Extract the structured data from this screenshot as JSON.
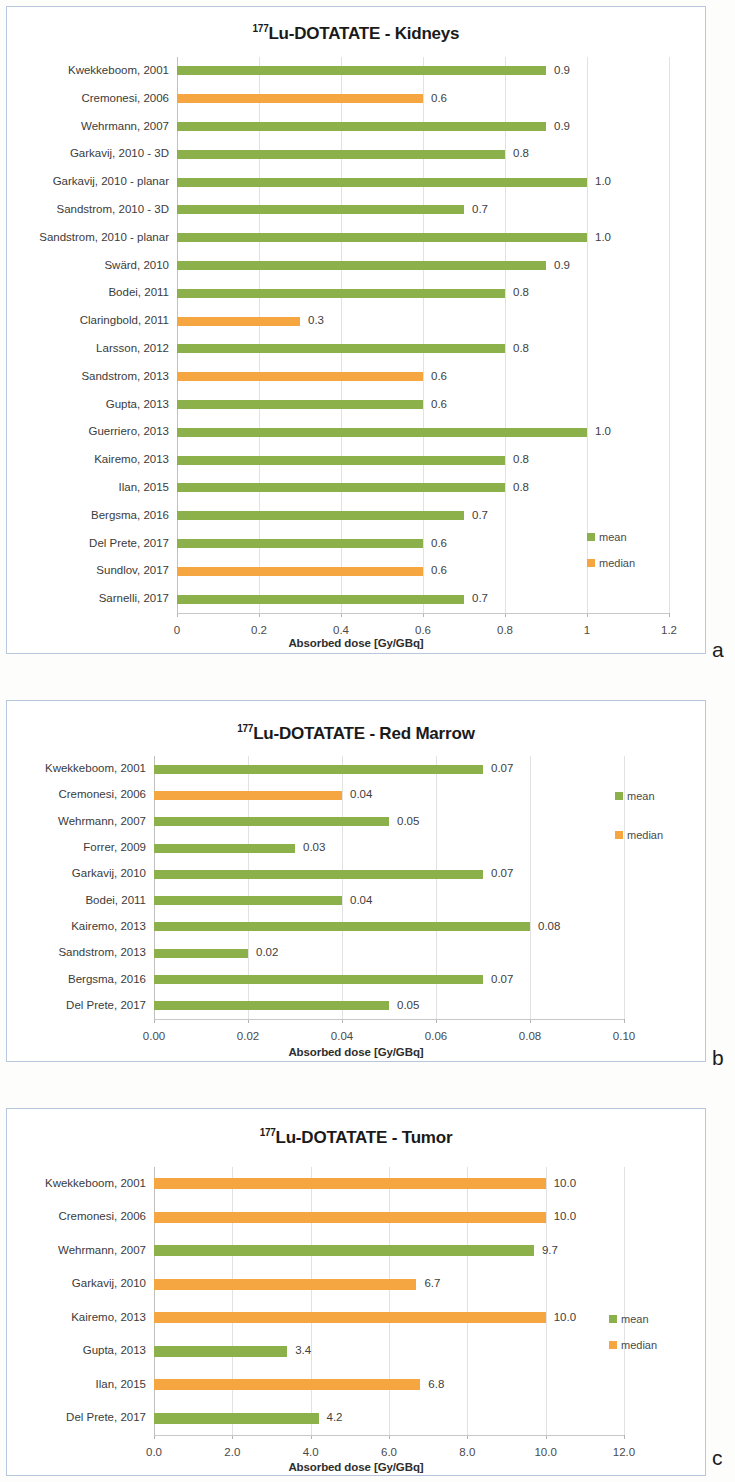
{
  "colors": {
    "mean": "#8CB04A",
    "median": "#F5A641",
    "panel_border": "#b9c7dd",
    "grid": "#e2e2e2",
    "text": "#3b3b3b"
  },
  "legend_labels": {
    "mean": "mean",
    "median": "median"
  },
  "panels": [
    {
      "letter": "a"
    },
    {
      "letter": "b"
    },
    {
      "letter": "c"
    }
  ],
  "chart_data": [
    {
      "type": "bar",
      "orientation": "horizontal",
      "title_prefix": "177",
      "title": "Lu-DOTATATE - Kidneys",
      "xlabel": "Absorbed dose [Gy/GBq]",
      "ylabel": "",
      "xlim": [
        0,
        1.2
      ],
      "xticks": [
        0,
        0.2,
        0.4,
        0.6,
        0.8,
        1,
        1.2
      ],
      "xticklabels": [
        "0",
        "0.2",
        "0.4",
        "0.6",
        "0.8",
        "1",
        "1.2"
      ],
      "grid": true,
      "legend_position": "right-lower",
      "legend": [
        "mean",
        "median"
      ],
      "categories": [
        "Kwekkeboom, 2001",
        "Cremonesi, 2006",
        "Wehrmann, 2007",
        "Garkavij, 2010 - 3D",
        "Garkavij, 2010 - planar",
        "Sandstrom, 2010 - 3D",
        "Sandstrom, 2010 - planar",
        "Swärd, 2010",
        "Bodei, 2011",
        "Claringbold, 2011",
        "Larsson, 2012",
        "Sandstrom, 2013",
        "Gupta, 2013",
        "Guerriero, 2013",
        "Kairemo, 2013",
        "Ilan, 2015",
        "Bergsma, 2016",
        "Del Prete, 2017",
        "Sundlov, 2017",
        "Sarnelli, 2017"
      ],
      "values": [
        0.9,
        0.6,
        0.9,
        0.8,
        1.0,
        0.7,
        1.0,
        0.9,
        0.8,
        0.3,
        0.8,
        0.6,
        0.6,
        1.0,
        0.8,
        0.8,
        0.7,
        0.6,
        0.6,
        0.7
      ],
      "value_labels": [
        "0.9",
        "0.6",
        "0.9",
        "0.8",
        "1.0",
        "0.7",
        "1.0",
        "0.9",
        "0.8",
        "0.3",
        "0.8",
        "0.6",
        "0.6",
        "1.0",
        "0.8",
        "0.8",
        "0.7",
        "0.6",
        "0.6",
        "0.7"
      ],
      "series_of": [
        "mean",
        "median",
        "mean",
        "mean",
        "mean",
        "mean",
        "mean",
        "mean",
        "mean",
        "median",
        "mean",
        "median",
        "mean",
        "mean",
        "mean",
        "mean",
        "mean",
        "mean",
        "median",
        "mean"
      ]
    },
    {
      "type": "bar",
      "orientation": "horizontal",
      "title_prefix": "177",
      "title": "Lu-DOTATATE - Red Marrow",
      "xlabel": "Absorbed dose [Gy/GBq]",
      "ylabel": "",
      "xlim": [
        0,
        0.1
      ],
      "xticks": [
        0,
        0.02,
        0.04,
        0.06,
        0.08,
        0.1
      ],
      "xticklabels": [
        "0.00",
        "0.02",
        "0.04",
        "0.06",
        "0.08",
        "0.10"
      ],
      "grid": true,
      "legend_position": "right-upper",
      "legend": [
        "mean",
        "median"
      ],
      "categories": [
        "Kwekkeboom, 2001",
        "Cremonesi, 2006",
        "Wehrmann, 2007",
        "Forrer, 2009",
        "Garkavij, 2010",
        "Bodei, 2011",
        "Kairemo, 2013",
        "Sandstrom, 2013",
        "Bergsma, 2016",
        "Del Prete, 2017"
      ],
      "values": [
        0.07,
        0.04,
        0.05,
        0.03,
        0.07,
        0.04,
        0.08,
        0.02,
        0.07,
        0.05
      ],
      "value_labels": [
        "0.07",
        "0.04",
        "0.05",
        "0.03",
        "0.07",
        "0.04",
        "0.08",
        "0.02",
        "0.07",
        "0.05"
      ],
      "series_of": [
        "mean",
        "median",
        "mean",
        "mean",
        "mean",
        "mean",
        "mean",
        "mean",
        "mean",
        "mean"
      ]
    },
    {
      "type": "bar",
      "orientation": "horizontal",
      "title_prefix": "177",
      "title": "Lu-DOTATATE - Tumor",
      "xlabel": "Absorbed dose [Gy/GBq]",
      "ylabel": "",
      "xlim": [
        0,
        12.0
      ],
      "xticks": [
        0,
        2,
        4,
        6,
        8,
        10,
        12
      ],
      "xticklabels": [
        "0.0",
        "2.0",
        "4.0",
        "6.0",
        "8.0",
        "10.0",
        "12.0"
      ],
      "grid": true,
      "legend_position": "right-lower",
      "legend": [
        "mean",
        "median"
      ],
      "categories": [
        "Kwekkeboom, 2001",
        "Cremonesi, 2006",
        "Wehrmann, 2007",
        "Garkavij, 2010",
        "Kairemo, 2013",
        "Gupta, 2013",
        "Ilan, 2015",
        "Del Prete, 2017"
      ],
      "values": [
        10.0,
        10.0,
        9.7,
        6.7,
        10.0,
        3.4,
        6.8,
        4.2
      ],
      "value_labels": [
        "10.0",
        "10.0",
        "9.7",
        "6.7",
        "10.0",
        "3.4",
        "6.8",
        "4.2"
      ],
      "series_of": [
        "median",
        "median",
        "mean",
        "median",
        "median",
        "mean",
        "median",
        "mean"
      ]
    }
  ]
}
